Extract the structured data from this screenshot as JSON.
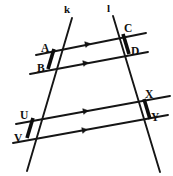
{
  "figure": {
    "background_color": "#ffffff",
    "stroke_color": "#111111",
    "width": 173,
    "height": 176
  },
  "transversals": [
    {
      "name": "line-k",
      "label": "k",
      "label_x": 64,
      "label_y": 13,
      "x1": 72,
      "y1": 18,
      "x2": 27,
      "y2": 171,
      "thin_width": 1.9
    },
    {
      "name": "line-l",
      "label": "l",
      "label_x": 107,
      "label_y": 12,
      "x1": 113,
      "y1": 16,
      "x2": 160,
      "y2": 172,
      "thin_width": 1.9
    }
  ],
  "parallel_lines": [
    {
      "name": "parallel-line-1",
      "x1": 36,
      "y1": 55,
      "x2": 146,
      "y2": 33,
      "arrow_x": 88,
      "arrow_y": 44,
      "arrow_count": 1
    },
    {
      "name": "parallel-line-2",
      "x1": 30,
      "y1": 74,
      "x2": 148,
      "y2": 52,
      "arrow_x": 86,
      "arrow_y": 63,
      "arrow_count": 1
    },
    {
      "name": "parallel-line-3",
      "x1": 16,
      "y1": 124,
      "x2": 170,
      "y2": 96,
      "arrow_x": 86,
      "arrow_y": 111,
      "arrow_count": 1
    },
    {
      "name": "parallel-line-4",
      "x1": 13,
      "y1": 143,
      "x2": 168,
      "y2": 115,
      "arrow_x": 85,
      "arrow_y": 130,
      "arrow_count": 1
    }
  ],
  "thick_segments": [
    {
      "name": "segment-AB",
      "x1": 54,
      "y1": 49,
      "x2": 48,
      "y2": 69
    },
    {
      "name": "segment-CD",
      "x1": 123,
      "y1": 34,
      "x2": 129,
      "y2": 54
    },
    {
      "name": "segment-UV",
      "x1": 33,
      "y1": 118,
      "x2": 27,
      "y2": 138
    },
    {
      "name": "segment-XY",
      "x1": 144,
      "y1": 99,
      "x2": 150,
      "y2": 119
    }
  ],
  "points": [
    {
      "name": "point-A",
      "label": "A",
      "px": 54,
      "py": 49,
      "label_x": 41,
      "label_y": 52
    },
    {
      "name": "point-B",
      "label": "B",
      "px": 48,
      "py": 69,
      "label_x": 37,
      "label_y": 72
    },
    {
      "name": "point-C",
      "label": "C",
      "px": 123,
      "py": 34,
      "label_x": 124,
      "label_y": 32
    },
    {
      "name": "point-D",
      "label": "D",
      "px": 129,
      "py": 54,
      "label_x": 131,
      "label_y": 55
    },
    {
      "name": "point-U",
      "label": "U",
      "px": 33,
      "py": 118,
      "label_x": 20,
      "label_y": 119
    },
    {
      "name": "point-V",
      "label": "V",
      "px": 27,
      "py": 138,
      "label_x": 14,
      "label_y": 142
    },
    {
      "name": "point-X",
      "label": "X",
      "px": 144,
      "py": 99,
      "label_x": 145,
      "label_y": 98
    },
    {
      "name": "point-Y",
      "label": "Y",
      "px": 150,
      "py": 119,
      "label_x": 151,
      "label_y": 121
    }
  ]
}
